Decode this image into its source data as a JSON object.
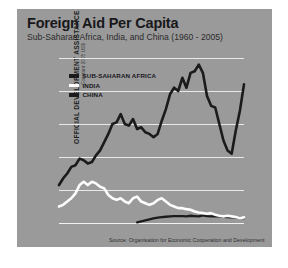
{
  "header": {
    "title": "Foreign Aid Per Capita",
    "subtitle": "Sub-Saharan Africa, India, and China (1960 - 2005)"
  },
  "axes": {
    "ylabel_main": "OFFICIAL DEVELOPMENT ASSISTANCE PER CAPITA",
    "ylabel_sub": "Constant 2005 US$",
    "ytick_labels": [
      "50",
      "40",
      "30",
      "20",
      "10",
      "0"
    ],
    "xtick_labels": [
      "1960",
      "65",
      "70",
      "75",
      "80",
      "85",
      "90",
      "95",
      "00",
      "2005"
    ]
  },
  "legend": {
    "items": [
      {
        "label": "SUB-SAHARAN AFRICA",
        "color": "#1b1b1d"
      },
      {
        "label": "INDIA",
        "color": "#fdfdfd"
      },
      {
        "label": "CHINA",
        "color": "#1b1b1d"
      }
    ]
  },
  "source": "Source: Organisation for Economic Cooperation and Development",
  "colors": {
    "panel_background": "#9a9a9a",
    "page_background": "#ffffff",
    "gridline": "#e9e9e9",
    "sub_saharan_africa": "#1b1b1d",
    "india": "#fdfdfd",
    "china": "#1b1b1d"
  },
  "chart_data": {
    "type": "line",
    "title": "Foreign Aid Per Capita",
    "subtitle": "Sub-Saharan Africa, India, and China (1960 - 2005)",
    "xlabel": "",
    "ylabel": "OFFICIAL DEVELOPMENT ASSISTANCE PER CAPITA (Constant 2005 US$)",
    "xlim": [
      1960,
      2005
    ],
    "ylim": [
      0,
      50
    ],
    "yticks": [
      0,
      10,
      20,
      30,
      40,
      50
    ],
    "xticks": [
      1960,
      1965,
      1970,
      1975,
      1980,
      1985,
      1990,
      1995,
      2000,
      2005
    ],
    "grid": true,
    "legend_position": "upper-left-inside",
    "source": "Source: Organisation for Economic Cooperation and Development",
    "x": [
      1960,
      1961,
      1962,
      1963,
      1964,
      1965,
      1966,
      1967,
      1968,
      1969,
      1970,
      1971,
      1972,
      1973,
      1974,
      1975,
      1976,
      1977,
      1978,
      1979,
      1980,
      1981,
      1982,
      1983,
      1984,
      1985,
      1986,
      1987,
      1988,
      1989,
      1990,
      1991,
      1992,
      1993,
      1994,
      1995,
      1996,
      1997,
      1998,
      1999,
      2000,
      2001,
      2002,
      2003,
      2004,
      2005
    ],
    "series": [
      {
        "name": "SUB-SAHARAN AFRICA",
        "color": "#1b1b1d",
        "values": [
          11.5,
          13.5,
          15.0,
          17.0,
          17.5,
          19.5,
          19.0,
          18.0,
          18.5,
          20.5,
          22.0,
          24.5,
          27.0,
          30.0,
          30.5,
          33.0,
          30.0,
          29.5,
          31.5,
          28.5,
          29.0,
          27.5,
          27.0,
          26.0,
          27.0,
          31.0,
          34.5,
          39.0,
          41.0,
          40.0,
          44.0,
          41.0,
          45.5,
          46.0,
          48.0,
          45.5,
          38.5,
          35.5,
          35.0,
          30.0,
          25.0,
          22.0,
          21.0,
          28.0,
          34.0,
          42.0
        ]
      },
      {
        "name": "INDIA",
        "color": "#fdfdfd",
        "values": [
          5.0,
          5.5,
          6.5,
          7.5,
          9.0,
          11.5,
          12.5,
          11.5,
          12.5,
          12.0,
          11.0,
          10.5,
          8.5,
          7.5,
          7.0,
          7.5,
          6.5,
          6.0,
          7.5,
          8.0,
          6.5,
          6.0,
          5.5,
          6.0,
          7.0,
          7.5,
          6.5,
          5.5,
          5.0,
          4.5,
          4.5,
          4.2,
          4.0,
          3.5,
          3.2,
          3.0,
          2.8,
          3.0,
          2.5,
          2.2,
          2.0,
          2.2,
          2.0,
          1.8,
          1.5,
          1.7
        ]
      },
      {
        "name": "CHINA",
        "color": "#1b1b1d",
        "values": [
          null,
          null,
          null,
          null,
          null,
          null,
          null,
          null,
          null,
          null,
          null,
          null,
          null,
          null,
          null,
          null,
          null,
          null,
          null,
          0.2,
          0.5,
          0.8,
          1.1,
          1.4,
          1.6,
          1.8,
          1.9,
          2.0,
          2.1,
          2.1,
          2.1,
          2.0,
          2.2,
          2.1,
          2.0,
          2.3,
          2.1,
          2.0,
          2.1,
          2.0,
          1.9,
          1.8,
          1.7,
          1.7,
          1.6,
          1.5
        ]
      }
    ]
  }
}
